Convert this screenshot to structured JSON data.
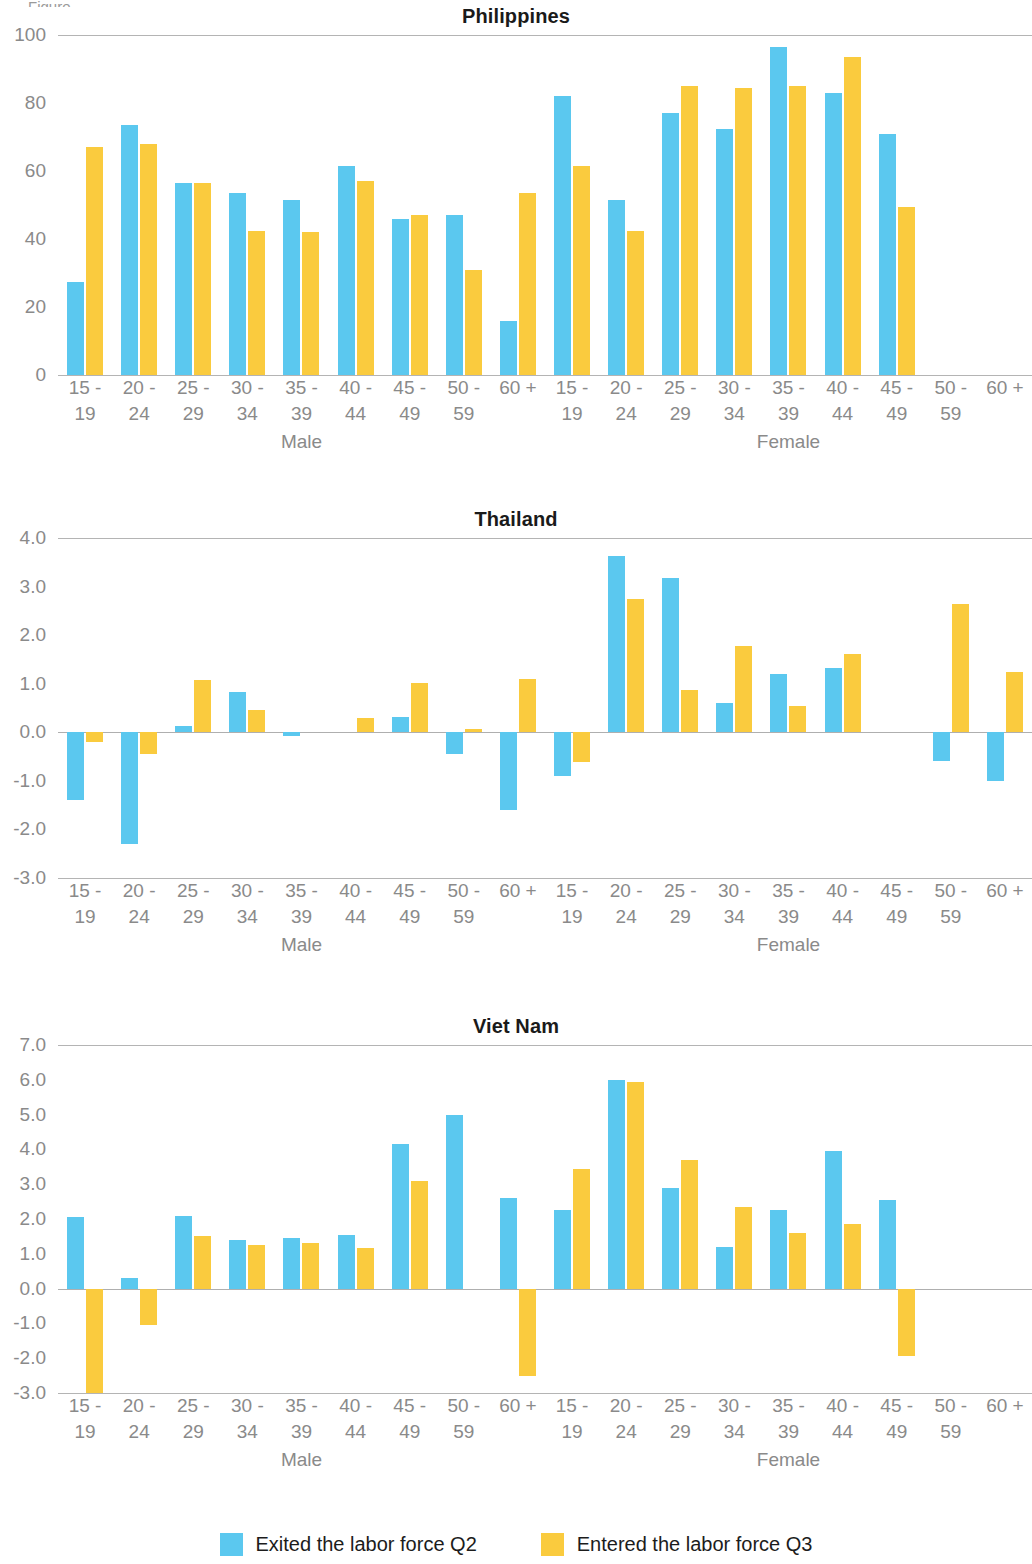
{
  "caption_fragment": "Figure",
  "colors": {
    "exited": "#5bc8ef",
    "entered": "#facb3e",
    "axis_text": "#8a8a8a",
    "gridline": "#9b9b9b",
    "title": "#1a1a1a"
  },
  "legend": {
    "items": [
      {
        "label": "Exited the labor force Q2",
        "color_key": "exited",
        "swatch": "blue-square-swatch"
      },
      {
        "label": "Entered the labor force Q3",
        "color_key": "entered",
        "swatch": "yellow-square-swatch"
      }
    ]
  },
  "sex_labels": {
    "male": "Male",
    "female": "Female"
  },
  "age_groups": [
    {
      "line1": "15 -",
      "line2": "19"
    },
    {
      "line1": "20 -",
      "line2": "24"
    },
    {
      "line1": "25 -",
      "line2": "29"
    },
    {
      "line1": "30 -",
      "line2": "34"
    },
    {
      "line1": "35 -",
      "line2": "39"
    },
    {
      "line1": "40 -",
      "line2": "44"
    },
    {
      "line1": "45 -",
      "line2": "49"
    },
    {
      "line1": "50 -",
      "line2": "59"
    },
    {
      "line1": "60 +",
      "line2": ""
    }
  ],
  "chart_data": [
    {
      "type": "bar",
      "title": "Philippines",
      "xlabel": "",
      "ylabel": "",
      "ylim": [
        0,
        100
      ],
      "yticks": [
        0,
        20,
        40,
        60,
        80,
        100
      ],
      "ytick_labels": [
        "0",
        "20",
        "40",
        "60",
        "80",
        "100"
      ],
      "grid": true,
      "legend_position": "bottom",
      "categories": [
        "Male 15 - 19",
        "Male 20 - 24",
        "Male 25 - 29",
        "Male 30 - 34",
        "Male 35 - 39",
        "Male 40 - 44",
        "Male 45 - 49",
        "Male 50 - 59",
        "Male 60 +",
        "Female 15 - 19",
        "Female 20 - 24",
        "Female 25 - 29",
        "Female 30 - 34",
        "Female 35 - 39",
        "Female 40 - 44",
        "Female 45 - 49",
        "Female 50 - 59",
        "Female 60 +"
      ],
      "series": [
        {
          "name": "Exited the labor force Q2",
          "color_key": "exited",
          "values": [
            27.5,
            73.5,
            56.5,
            53.5,
            51.5,
            61.5,
            46.0,
            47.0,
            16.0,
            82.0,
            51.5,
            77.0,
            72.5,
            96.5,
            83.0,
            71.0,
            0,
            0
          ]
        },
        {
          "name": "Entered the labor force Q3",
          "color_key": "entered",
          "values": [
            67.0,
            68.0,
            56.5,
            42.5,
            42.0,
            57.0,
            47.0,
            31.0,
            53.5,
            61.5,
            42.5,
            85.0,
            84.5,
            85.0,
            93.5,
            49.5,
            0,
            0
          ]
        }
      ],
      "note": "values are ordered Male 15-19 .. Male 60+, then Female 15-19 .. Female 60+"
    },
    {
      "type": "bar",
      "title": "Thailand",
      "xlabel": "",
      "ylabel": "",
      "ylim": [
        -3.0,
        4.0
      ],
      "yticks": [
        -3.0,
        -2.0,
        -1.0,
        0.0,
        1.0,
        2.0,
        3.0,
        4.0
      ],
      "ytick_labels": [
        "-3.0",
        "-2.0",
        "-1.0",
        "0.0",
        "1.0",
        "2.0",
        "3.0",
        "4.0"
      ],
      "grid": true,
      "legend_position": "bottom",
      "categories": [
        "Male 15 - 19",
        "Male 20 - 24",
        "Male 25 - 29",
        "Male 30 - 34",
        "Male 35 - 39",
        "Male 40 - 44",
        "Male 45 - 49",
        "Male 50 - 59",
        "Male 60 +",
        "Female 15 - 19",
        "Female 20 - 24",
        "Female 25 - 29",
        "Female 30 - 34",
        "Female 35 - 39",
        "Female 40 - 44",
        "Female 45 - 49",
        "Female 50 - 59",
        "Female 60 +"
      ],
      "series": [
        {
          "name": "Exited the labor force Q2",
          "color_key": "exited",
          "values": [
            -1.4,
            -2.3,
            0.12,
            0.82,
            -0.08,
            0.0,
            0.32,
            -0.45,
            -1.6,
            -0.9,
            3.62,
            3.18,
            0.6,
            1.2,
            1.32,
            0.0,
            -0.6,
            -1.0
          ]
        },
        {
          "name": "Entered the labor force Q3",
          "color_key": "entered",
          "values": [
            -0.2,
            -0.45,
            1.08,
            0.45,
            0.0,
            0.3,
            1.02,
            0.07,
            1.1,
            -0.62,
            2.75,
            0.88,
            1.78,
            0.55,
            1.62,
            0.0,
            2.65,
            1.25
          ]
        }
      ]
    },
    {
      "type": "bar",
      "title": "Viet Nam",
      "xlabel": "",
      "ylabel": "",
      "ylim": [
        -3.0,
        7.0
      ],
      "yticks": [
        -3.0,
        -2.0,
        -1.0,
        0.0,
        1.0,
        2.0,
        3.0,
        4.0,
        5.0,
        6.0,
        7.0
      ],
      "ytick_labels": [
        "-3.0",
        "-2.0",
        "-1.0",
        "0.0",
        "1.0",
        "2.0",
        "3.0",
        "4.0",
        "5.0",
        "6.0",
        "7.0"
      ],
      "grid": true,
      "legend_position": "bottom",
      "categories": [
        "Male 15 - 19",
        "Male 20 - 24",
        "Male 25 - 29",
        "Male 30 - 34",
        "Male 35 - 39",
        "Male 40 - 44",
        "Male 45 - 49",
        "Male 50 - 59",
        "Male 60 +",
        "Female 15 - 19",
        "Female 20 - 24",
        "Female 25 - 29",
        "Female 30 - 34",
        "Female 35 - 39",
        "Female 40 - 44",
        "Female 45 - 49",
        "Female 50 - 59",
        "Female 60 +"
      ],
      "series": [
        {
          "name": "Exited the labor force Q2",
          "color_key": "exited",
          "values": [
            2.05,
            0.3,
            2.1,
            1.4,
            1.45,
            1.55,
            4.15,
            5.0,
            2.6,
            2.25,
            6.0,
            2.9,
            1.2,
            2.25,
            3.95,
            2.55,
            0,
            0
          ]
        },
        {
          "name": "Entered the labor force Q3",
          "color_key": "entered",
          "values": [
            -3.2,
            -1.05,
            1.5,
            1.25,
            1.3,
            1.18,
            3.1,
            0.0,
            -2.5,
            3.45,
            5.95,
            3.7,
            2.35,
            1.6,
            1.85,
            -1.95,
            0,
            0
          ]
        }
      ]
    }
  ]
}
